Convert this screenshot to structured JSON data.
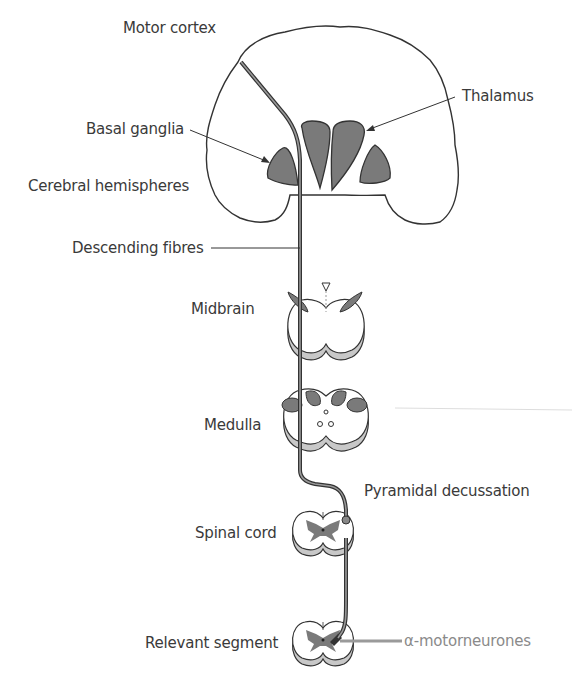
{
  "diagram": {
    "labels": {
      "motor_cortex": "Motor cortex",
      "thalamus": "Thalamus",
      "basal_ganglia": "Basal ganglia",
      "cerebral_hemispheres": "Cerebral hemispheres",
      "descending_fibres": "Descending fibres",
      "midbrain": "Midbrain",
      "medulla": "Medulla",
      "pyramidal_decussation": "Pyramidal decussation",
      "spinal_cord": "Spinal cord",
      "relevant_segment": "Relevant segment",
      "alpha_motorneurones": "α-motorneurones"
    },
    "colors": {
      "outline": "#333333",
      "nucleus_fill": "#7a7a7a",
      "shadow_fill": "#c8c8c8",
      "tract": "#555555",
      "motorneuron_line": "#9a9a9a",
      "label_text": "#3a3a3a",
      "alpha_label_text": "#8a8a8a"
    }
  }
}
